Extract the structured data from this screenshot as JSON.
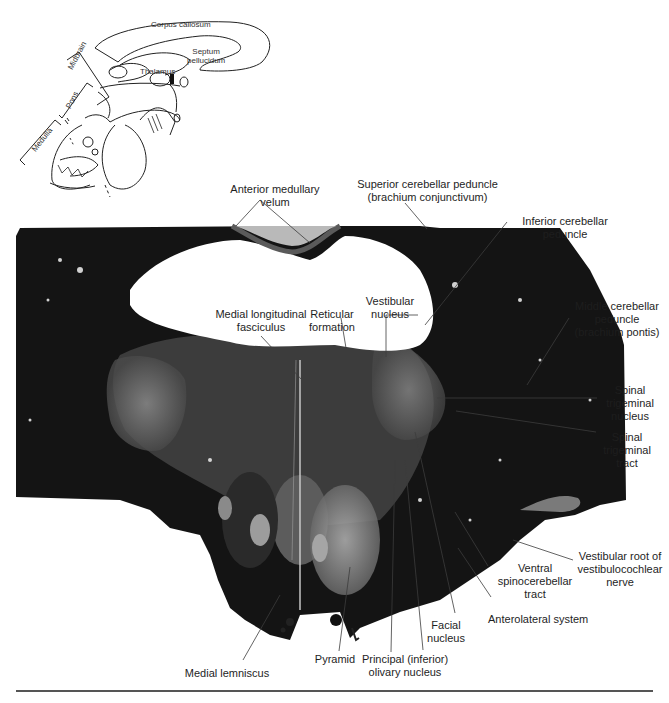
{
  "figure": {
    "inset": {
      "title": "Sagittal brain orientation inset",
      "labels": {
        "corpus_callosum": "Corpus callosum",
        "septum_pellucidum": "Septum\npellucidum",
        "thalamus": "Thalamus",
        "midbrain": "Midbrain",
        "pons": "Pons",
        "medulla": "Medulla"
      }
    },
    "section_labels": {
      "anterior_medullary_velum": "Anterior medullary\nvelum",
      "superior_cerebellar_peduncle": "Superior cerebellar peduncle\n(brachium conjunctivum)",
      "inferior_cerebellar_peduncle": "Inferior cerebellar\npeduncle",
      "middle_cerebellar_peduncle": "Middle cerebellar\npeduncle\n(brachium pontis)",
      "medial_longitudinal_fasciculus": "Medial longitudinal\nfasciculus",
      "reticular_formation": "Reticular\nformation",
      "vestibular_nucleus": "Vestibular\nnucleus",
      "spinal_trigeminal_nucleus": "Spinal\ntrigeminal\nnucleus",
      "spinal_trigeminal_tract": "Spinal\ntrigeminal\ntract",
      "vestibular_root": "Vestibular root of\nvestibulocochlear\nnerve",
      "ventral_spinocerebellar_tract": "Ventral\nspinocerebellar\ntract",
      "anterolateral_system": "Anterolateral system",
      "facial_nucleus": "Facial\nnucleus",
      "principal_olivary_nucleus": "Principal (inferior)\nolivary nucleus",
      "pyramid": "Pyramid",
      "medial_lemniscus": "Medial lemniscus"
    },
    "colors": {
      "tissue_dark": "#141414",
      "tissue_mid": "#3a3a3a",
      "tissue_light": "#9a9a9a",
      "ventricle": "#ffffff",
      "leader_line": "#3c3c3c"
    }
  }
}
